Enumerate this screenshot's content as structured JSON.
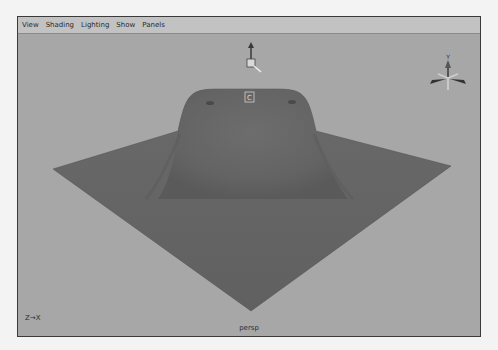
{
  "menubar": {
    "items": [
      {
        "label": "View"
      },
      {
        "label": "Shading"
      },
      {
        "label": "Lighting"
      },
      {
        "label": "Show"
      },
      {
        "label": "Panels"
      }
    ]
  },
  "viewport": {
    "camera_name": "persp",
    "axis_indicator": "Z→X",
    "pivot_marker": "C",
    "view_cube_label": "Y",
    "colors": {
      "background": "#a7a7a7",
      "surface": "#676767",
      "surface_shadow": "#555555"
    }
  }
}
